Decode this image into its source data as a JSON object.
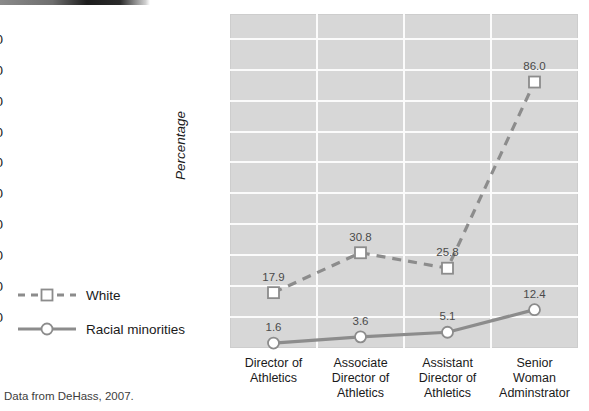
{
  "caption": "Data from DeHass, 2007.",
  "axis": {
    "ylabel": "Percentage",
    "yticks": [
      "10",
      "20",
      "30",
      "40",
      "50",
      "60",
      "70",
      "80",
      "90",
      "100"
    ]
  },
  "legend": {
    "items": [
      {
        "label": "White",
        "style": "dashed",
        "marker": "square",
        "color": "#8c8c8c"
      },
      {
        "label": "Racial minorities",
        "style": "solid",
        "marker": "circle",
        "color": "#8c8c8c"
      }
    ]
  },
  "chart_data": {
    "type": "line",
    "title": "",
    "subtitle": "",
    "xlabel": "",
    "ylabel": "Percentage",
    "ylim": [
      0,
      108
    ],
    "yticks": [
      10,
      20,
      30,
      40,
      50,
      60,
      70,
      80,
      90,
      100
    ],
    "grid": true,
    "legend_position": "left-outside",
    "categories": [
      "Director of Athletics",
      "Associate Director of Athletics",
      "Assistant Director of Athletics",
      "Senior Woman Adminstrator"
    ],
    "category_lines": [
      [
        "Director of",
        "Athletics"
      ],
      [
        "Associate",
        "Director of",
        "Athletics"
      ],
      [
        "Assistant",
        "Director of",
        "Athletics"
      ],
      [
        "Senior",
        "Woman",
        "Adminstrator"
      ]
    ],
    "series": [
      {
        "name": "White",
        "style": "dashed",
        "marker": "square",
        "color": "#8c8c8c",
        "values": [
          17.9,
          30.8,
          25.8,
          86.0
        ],
        "labels": [
          "17.9",
          "30.8",
          "25.8",
          "86.0"
        ]
      },
      {
        "name": "Racial minorities",
        "style": "solid",
        "marker": "circle",
        "color": "#8c8c8c",
        "values": [
          1.6,
          3.6,
          5.1,
          12.4
        ],
        "labels": [
          "1.6",
          "3.6",
          "5.1",
          "12.4"
        ]
      }
    ],
    "annotations": [
      "Data from DeHass, 2007."
    ]
  },
  "colors": {
    "plot_background": "#d7d7d7",
    "gridline": "#fbfbfb",
    "series": "#8c8c8c",
    "marker_fill": "#ffffff",
    "text": "#1a1a1a"
  }
}
